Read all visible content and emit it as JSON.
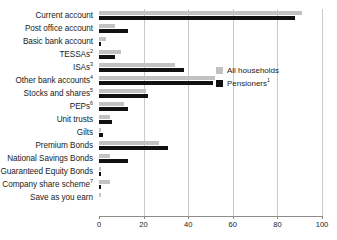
{
  "chart_data": {
    "type": "bar",
    "orientation": "horizontal",
    "title": "",
    "xlabel": "",
    "ylabel": "",
    "xlim": [
      0,
      100
    ],
    "xticks": [
      0,
      20,
      40,
      60,
      80,
      100
    ],
    "grid": true,
    "legend_position": "right",
    "categories": [
      "Current account",
      "Post office account",
      "Basic bank account",
      "TESSAs",
      "ISAs",
      "Other bank accounts",
      "Stocks and shares",
      "PEPs",
      "Unit trusts",
      "Gilts",
      "Premium Bonds",
      "National Savings Bonds",
      "Guaranteed Equity Bonds",
      "Company share scheme",
      "Save as you earn"
    ],
    "category_footnotes": [
      "",
      "",
      "",
      "2",
      "3",
      "4",
      "5",
      "6",
      "",
      "",
      "",
      "",
      "",
      "7",
      ""
    ],
    "series": [
      {
        "name": "All households",
        "footnote": "",
        "color": "#c2c2c2",
        "values": [
          91,
          7,
          3,
          10,
          34,
          52,
          21,
          11,
          5,
          1,
          27,
          5,
          1,
          5,
          1
        ]
      },
      {
        "name": "Pensioners",
        "footnote": "1",
        "color": "#111111",
        "values": [
          88,
          13,
          1,
          7,
          38,
          51,
          22,
          13,
          6,
          2,
          31,
          13,
          1,
          1,
          0
        ]
      }
    ]
  },
  "legend": {
    "items": [
      {
        "label": "All households",
        "footnote": "",
        "color": "#c2c2c2"
      },
      {
        "label": "Pensioners",
        "footnote": "1",
        "color": "#111111"
      }
    ]
  },
  "axis": {
    "tick_labels": [
      "0",
      "20",
      "40",
      "60",
      "80",
      "100"
    ]
  }
}
